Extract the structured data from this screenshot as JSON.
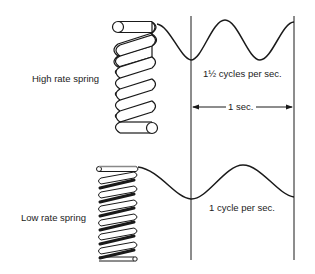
{
  "diagram": {
    "labels": {
      "high_rate_spring": "High rate spring",
      "low_rate_spring": "Low rate spring",
      "high_rate_frequency": "1½ cycles per sec.",
      "low_rate_frequency": "1 cycle per sec.",
      "time_interval": "1 sec."
    },
    "colors": {
      "ink": "#1a1a1a",
      "background": "#ffffff"
    },
    "springs": [
      {
        "name": "high-rate-spring",
        "coils": 5,
        "style": "thick-wire"
      },
      {
        "name": "low-rate-spring",
        "coils": 6,
        "style": "thin-wire"
      }
    ],
    "waves": [
      {
        "name": "high-rate-oscillation",
        "cycles_per_second": 1.5
      },
      {
        "name": "low-rate-oscillation",
        "cycles_per_second": 1
      }
    ]
  }
}
